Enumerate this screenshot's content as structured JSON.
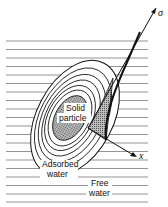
{
  "diagram": {
    "labels": {
      "particle_line1": "Solid",
      "particle_line2": "particle",
      "adsorbed_line1": "Adsorbed",
      "adsorbed_line2": "water",
      "free_line1": "Free",
      "free_line2": "water",
      "axis_x": "x",
      "axis_sigma": "σ"
    },
    "colors": {
      "ink": "#111111",
      "background": "#ffffff",
      "particle_fill": "#8a8a8a",
      "lines": "#555555"
    }
  }
}
